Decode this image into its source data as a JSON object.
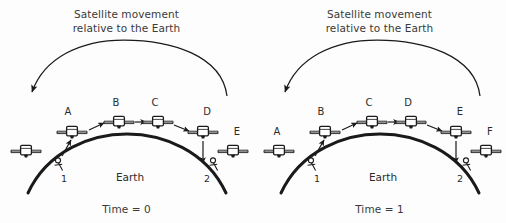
{
  "figure": {
    "background": "#fdfdfd",
    "ink": "#1a1a1a",
    "text_color": "#2b2b2b"
  },
  "panels": [
    {
      "id": "time-0",
      "title_line1": "Satellite movement",
      "title_line2": "relative to the Earth",
      "caption": "Time = 0",
      "earth_label": "Earth",
      "ground_stations": [
        {
          "label": "1",
          "x": 65,
          "y": 160
        },
        {
          "label": "2",
          "x": 208,
          "y": 160
        }
      ],
      "orbit_arrow": {
        "name": "satellite-movement-arc-arrow",
        "direction": "leftward",
        "path": "M 227,96 C 222,55 170,40 124,40 C 80,40 44,58 32,92",
        "arrow_at": "start-of-sweep-left"
      },
      "satellites": [
        {
          "label": "A",
          "x": 72,
          "y": 131,
          "label_x": 70,
          "label_y": 116,
          "show_label": true
        },
        {
          "label": "B",
          "x": 119,
          "y": 122,
          "label_x": 116,
          "label_y": 107,
          "show_label": true
        },
        {
          "label": "C",
          "x": 158,
          "y": 122,
          "label_x": 155,
          "label_y": 107,
          "show_label": true
        },
        {
          "label": "D",
          "x": 203,
          "y": 131,
          "label_x": 204,
          "label_y": 116,
          "show_label": true
        },
        {
          "label": "E",
          "x": 233,
          "y": 150,
          "label_x": 235,
          "label_y": 136,
          "show_label": true
        },
        {
          "label": "",
          "x": 26,
          "y": 150,
          "label_x": 0,
          "label_y": 0,
          "show_label": false
        }
      ],
      "hop_arrows": [
        {
          "name": "hop-launch-to-a",
          "d": "M 62,155 L 70,140"
        },
        {
          "name": "hop-a-to-b",
          "d": "M 88,129 L 104,122"
        },
        {
          "name": "hop-b-to-c",
          "d": "M 133,122 L 145,122"
        },
        {
          "name": "hop-c-to-d",
          "d": "M 172,124 L 189,131"
        },
        {
          "name": "hop-d-to-site2",
          "d": "M 203,140 L 203,163"
        }
      ]
    },
    {
      "id": "time-1",
      "title_line1": "Satellite movement",
      "title_line2": "relative to the Earth",
      "caption": "Time = 1",
      "earth_label": "Earth",
      "ground_stations": [
        {
          "label": "1",
          "x": 65,
          "y": 160
        },
        {
          "label": "2",
          "x": 208,
          "y": 160
        }
      ],
      "orbit_arrow": {
        "name": "satellite-movement-arc-arrow",
        "direction": "leftward",
        "path": "M 227,96 C 222,55 170,40 124,40 C 80,40 44,58 32,92",
        "arrow_at": "start-of-sweep-left"
      },
      "satellites": [
        {
          "label": "A",
          "x": 26,
          "y": 150,
          "label_x": 24,
          "label_y": 136,
          "show_label": true
        },
        {
          "label": "B",
          "x": 72,
          "y": 131,
          "label_x": 70,
          "label_y": 116,
          "show_label": true
        },
        {
          "label": "C",
          "x": 119,
          "y": 122,
          "label_x": 116,
          "label_y": 107,
          "show_label": true
        },
        {
          "label": "D",
          "x": 158,
          "y": 122,
          "label_x": 155,
          "label_y": 107,
          "show_label": true
        },
        {
          "label": "E",
          "x": 203,
          "y": 131,
          "label_x": 204,
          "label_y": 116,
          "show_label": true
        },
        {
          "label": "F",
          "x": 233,
          "y": 150,
          "label_x": 235,
          "label_y": 136,
          "show_label": true
        }
      ],
      "hop_arrows": [
        {
          "name": "hop-launch-to-b",
          "d": "M 62,155 L 70,140"
        },
        {
          "name": "hop-b-to-c",
          "d": "M 88,129 L 104,122"
        },
        {
          "name": "hop-c-to-d",
          "d": "M 133,122 L 145,122"
        },
        {
          "name": "hop-d-to-e",
          "d": "M 172,124 L 189,131"
        },
        {
          "name": "hop-e-to-site2",
          "d": "M 203,140 L 203,163"
        }
      ]
    }
  ],
  "earth_arc": {
    "name": "earth-surface-arc",
    "path": "M 28,193 C 48,150 92,134 127,134 C 162,134 206,150 226,193",
    "stroke_width": 3
  },
  "satellite_icon": {
    "name": "satellite-icon",
    "description": "small body box with solar panel wings left and right"
  }
}
